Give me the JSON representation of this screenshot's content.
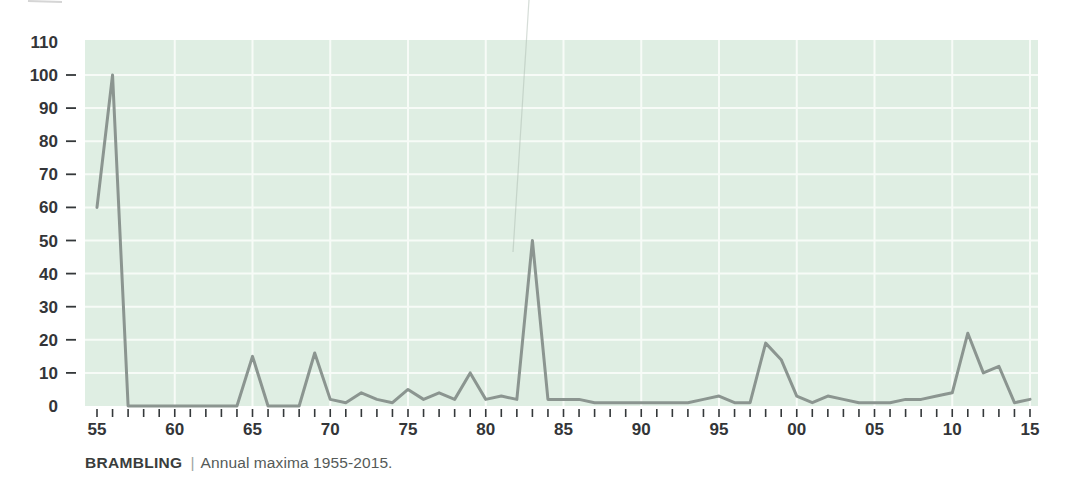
{
  "caption": {
    "species": "BRAMBLING",
    "separator": "|",
    "text": "Annual maxima 1955-2015."
  },
  "chart_data": {
    "type": "line",
    "xlabel": "",
    "ylabel": "",
    "legend": "none",
    "grid": "on",
    "x": [
      1955,
      1956,
      1957,
      1958,
      1959,
      1960,
      1961,
      1962,
      1963,
      1964,
      1965,
      1966,
      1967,
      1968,
      1969,
      1970,
      1971,
      1972,
      1973,
      1974,
      1975,
      1976,
      1977,
      1978,
      1979,
      1980,
      1981,
      1982,
      1983,
      1984,
      1985,
      1986,
      1987,
      1988,
      1989,
      1990,
      1991,
      1992,
      1993,
      1994,
      1995,
      1996,
      1997,
      1998,
      1999,
      2000,
      2001,
      2002,
      2003,
      2004,
      2005,
      2006,
      2007,
      2008,
      2009,
      2010,
      2011,
      2012,
      2013,
      2014,
      2015
    ],
    "values": [
      60,
      100,
      0,
      0,
      0,
      0,
      0,
      0,
      0,
      0,
      15,
      0,
      0,
      0,
      16,
      2,
      1,
      4,
      2,
      1,
      5,
      2,
      4,
      2,
      10,
      2,
      3,
      2,
      50,
      2,
      2,
      2,
      1,
      1,
      1,
      1,
      1,
      1,
      1,
      2,
      3,
      1,
      1,
      19,
      14,
      3,
      1,
      3,
      2,
      1,
      1,
      1,
      2,
      2,
      3,
      4,
      22,
      10,
      12,
      1,
      2
    ],
    "xlim": [
      1954.25,
      2015.55
    ],
    "ylim": [
      0,
      110.6
    ],
    "x_tick_labels": [
      {
        "year": 1955,
        "label": "55"
      },
      {
        "year": 1960,
        "label": "60"
      },
      {
        "year": 1965,
        "label": "65"
      },
      {
        "year": 1970,
        "label": "70"
      },
      {
        "year": 1975,
        "label": "75"
      },
      {
        "year": 1980,
        "label": "80"
      },
      {
        "year": 1985,
        "label": "85"
      },
      {
        "year": 1990,
        "label": "90"
      },
      {
        "year": 1995,
        "label": "95"
      },
      {
        "year": 2000,
        "label": "00"
      },
      {
        "year": 2005,
        "label": "05"
      },
      {
        "year": 2010,
        "label": "10"
      },
      {
        "year": 2015,
        "label": "15"
      }
    ],
    "y_tick_labels": [
      0,
      10,
      20,
      30,
      40,
      50,
      60,
      70,
      80,
      90,
      100,
      110
    ],
    "y_dash_values": [
      10,
      20,
      30,
      40,
      50,
      60,
      70,
      80,
      90,
      100
    ],
    "grid_vertical_years": [
      1960,
      1965,
      1970,
      1975,
      1980,
      1985,
      1990,
      1995,
      2000,
      2005,
      2010,
      2015
    ],
    "grid_horizontal_values": [
      10,
      20,
      30,
      40,
      50,
      60,
      70,
      80,
      90,
      100
    ],
    "colors": {
      "plot_bg": "#dfeee3",
      "gridline": "#f7fbf7",
      "line": "#8b9590",
      "tick": "#34383a",
      "axis_label": "#333538",
      "artifact": "#aebdb2"
    }
  }
}
